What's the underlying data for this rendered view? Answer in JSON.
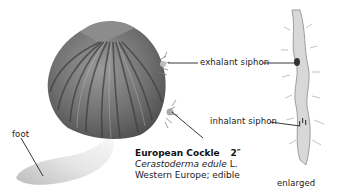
{
  "illustration": {
    "subject": "European Cockle",
    "labels": {
      "exhalant": "exhalant siphon",
      "inhalant": "inhalant siphon",
      "foot": "foot",
      "enlarged": "enlarged"
    }
  },
  "caption": {
    "title": "European Cockle",
    "size": "2″",
    "scientific_name": "Cerastoderma edule",
    "author": "L.",
    "range_use": "Western Europe; edible"
  }
}
